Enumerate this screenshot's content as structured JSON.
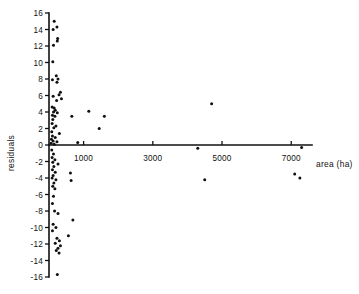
{
  "chart_data": {
    "type": "scatter",
    "title": "",
    "xlabel": "area (ha)",
    "ylabel": "residuals",
    "xlim": [
      0,
      7600
    ],
    "ylim": [
      -16,
      16
    ],
    "grid": false,
    "legend": null,
    "xticks": [
      1000,
      3000,
      5000,
      7000
    ],
    "xtick_labels": [
      "1000",
      "3000",
      "5000",
      "7000"
    ],
    "yticks": [
      -16,
      -14,
      -12,
      -10,
      -8,
      -6,
      -4,
      -2,
      0,
      2,
      4,
      6,
      8,
      10,
      12,
      14,
      16
    ],
    "ytick_labels": [
      "-16",
      "-14",
      "-12",
      "-10",
      "-8",
      "-6",
      "-4",
      "-2",
      "0",
      "2",
      "4",
      "6",
      "8",
      "10",
      "12",
      "14",
      "16"
    ],
    "marker": "dot",
    "marker_color": "#101010",
    "axis_color": "#111111",
    "points": [
      {
        "x": 150,
        "y": 15.0
      },
      {
        "x": 230,
        "y": 14.3
      },
      {
        "x": 120,
        "y": 14.0
      },
      {
        "x": 250,
        "y": 12.9
      },
      {
        "x": 240,
        "y": 12.6
      },
      {
        "x": 130,
        "y": 12.1
      },
      {
        "x": 110,
        "y": 10.1
      },
      {
        "x": 210,
        "y": 8.4
      },
      {
        "x": 260,
        "y": 8.0
      },
      {
        "x": 230,
        "y": 7.6
      },
      {
        "x": 100,
        "y": 7.9
      },
      {
        "x": 330,
        "y": 6.4
      },
      {
        "x": 290,
        "y": 6.1
      },
      {
        "x": 120,
        "y": 5.9
      },
      {
        "x": 360,
        "y": 5.6
      },
      {
        "x": 220,
        "y": 5.4
      },
      {
        "x": 4700,
        "y": 5.0
      },
      {
        "x": 90,
        "y": 4.6
      },
      {
        "x": 150,
        "y": 4.5
      },
      {
        "x": 180,
        "y": 4.2
      },
      {
        "x": 130,
        "y": 4.0
      },
      {
        "x": 240,
        "y": 3.9
      },
      {
        "x": 1150,
        "y": 4.1
      },
      {
        "x": 100,
        "y": 3.6
      },
      {
        "x": 170,
        "y": 3.5
      },
      {
        "x": 660,
        "y": 3.5
      },
      {
        "x": 1600,
        "y": 3.5
      },
      {
        "x": 110,
        "y": 3.1
      },
      {
        "x": 90,
        "y": 2.6
      },
      {
        "x": 200,
        "y": 2.3
      },
      {
        "x": 140,
        "y": 2.1
      },
      {
        "x": 1450,
        "y": 2.0
      },
      {
        "x": 80,
        "y": 1.6
      },
      {
        "x": 300,
        "y": 1.4
      },
      {
        "x": 100,
        "y": 1.1
      },
      {
        "x": 180,
        "y": 0.9
      },
      {
        "x": 70,
        "y": 0.7
      },
      {
        "x": 120,
        "y": 0.5
      },
      {
        "x": 230,
        "y": 0.4
      },
      {
        "x": 60,
        "y": 0.2
      },
      {
        "x": 150,
        "y": 0.1
      },
      {
        "x": 830,
        "y": 0.3
      },
      {
        "x": 4300,
        "y": -0.4
      },
      {
        "x": 7300,
        "y": -0.3
      },
      {
        "x": 80,
        "y": -0.6
      },
      {
        "x": 130,
        "y": -1.1
      },
      {
        "x": 90,
        "y": -1.5
      },
      {
        "x": 170,
        "y": -1.8
      },
      {
        "x": 110,
        "y": -2.1
      },
      {
        "x": 260,
        "y": -2.3
      },
      {
        "x": 140,
        "y": -2.6
      },
      {
        "x": 100,
        "y": -3.0
      },
      {
        "x": 180,
        "y": -3.3
      },
      {
        "x": 620,
        "y": -3.4
      },
      {
        "x": 120,
        "y": -3.7
      },
      {
        "x": 90,
        "y": -4.0
      },
      {
        "x": 200,
        "y": -4.2
      },
      {
        "x": 640,
        "y": -4.3
      },
      {
        "x": 4500,
        "y": -4.2
      },
      {
        "x": 7100,
        "y": -3.5
      },
      {
        "x": 7250,
        "y": -4.0
      },
      {
        "x": 140,
        "y": -4.6
      },
      {
        "x": 110,
        "y": -5.0
      },
      {
        "x": 170,
        "y": -5.3
      },
      {
        "x": 130,
        "y": -6.2
      },
      {
        "x": 100,
        "y": -7.1
      },
      {
        "x": 160,
        "y": -8.0
      },
      {
        "x": 260,
        "y": -8.3
      },
      {
        "x": 690,
        "y": -9.1
      },
      {
        "x": 120,
        "y": -9.6
      },
      {
        "x": 200,
        "y": -10.0
      },
      {
        "x": 100,
        "y": -10.4
      },
      {
        "x": 560,
        "y": -11.0
      },
      {
        "x": 230,
        "y": -11.3
      },
      {
        "x": 300,
        "y": -11.6
      },
      {
        "x": 180,
        "y": -11.9
      },
      {
        "x": 330,
        "y": -12.2
      },
      {
        "x": 260,
        "y": -12.5
      },
      {
        "x": 210,
        "y": -12.8
      },
      {
        "x": 290,
        "y": -13.1
      },
      {
        "x": 240,
        "y": -15.7
      }
    ]
  }
}
